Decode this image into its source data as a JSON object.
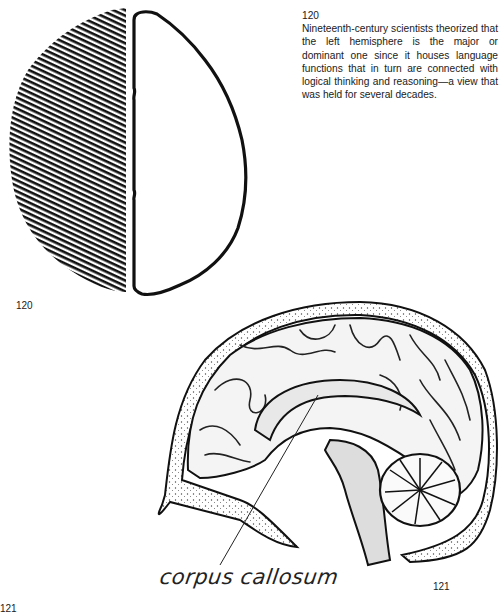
{
  "figure_120": {
    "illustration": "left-right-hemispheres-diagram",
    "left_hemisphere_style": "hatched",
    "right_hemisphere_style": "outline",
    "label": "120"
  },
  "caption": {
    "number": "120",
    "text": "Nineteenth-century scientists theorized that the left hemisphere is the major or dominant one since it houses language functions that in turn are connected with logical thinking and reasoning—a view that was held for several decades."
  },
  "figure_121": {
    "illustration": "sagittal-brain-section",
    "annotation": "corpus callosum",
    "label": "121"
  },
  "next_figure_label": "121",
  "colors": {
    "ink": "#111111",
    "paper": "#ffffff",
    "shading": "#bdbdbd"
  }
}
